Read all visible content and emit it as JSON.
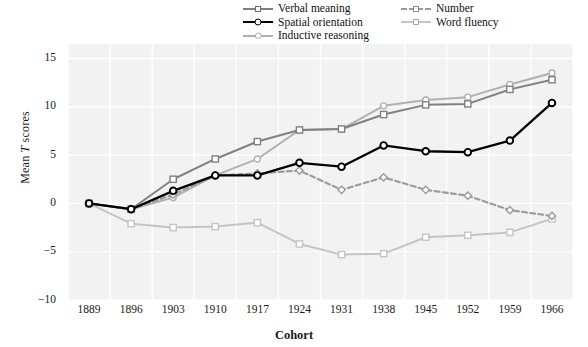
{
  "chart_data": {
    "type": "line",
    "title": "",
    "xlabel": "Cohort",
    "ylabel": "Mean T scores",
    "categories": [
      1889,
      1896,
      1903,
      1910,
      1917,
      1924,
      1931,
      1938,
      1945,
      1952,
      1959,
      1966
    ],
    "xtick_labels": [
      "1889",
      "1896",
      "1903",
      "1910",
      "1917",
      "1924",
      "1931",
      "1938",
      "1945",
      "1952",
      "1959",
      "1966"
    ],
    "ytick_labels": [
      "15",
      "10",
      "5",
      "0",
      "-5",
      "-10"
    ],
    "ytick_values": [
      15,
      10,
      5,
      0,
      -5,
      -10
    ],
    "ylim": [
      -10,
      16.5
    ],
    "grid": true,
    "legend_position": "top-right",
    "series": [
      {
        "name": "Verbal meaning",
        "color": "#808080",
        "marker": "square",
        "dash": "solid",
        "values": [
          0.0,
          -0.6,
          2.5,
          4.6,
          6.4,
          7.6,
          7.7,
          9.2,
          10.2,
          10.3,
          11.8,
          12.8
        ]
      },
      {
        "name": "Spatial orientation",
        "color": "#000000",
        "marker": "circle",
        "dash": "solid",
        "values": [
          0.0,
          -0.6,
          1.3,
          2.9,
          2.9,
          4.2,
          3.8,
          6.0,
          5.4,
          5.3,
          6.5,
          10.4
        ]
      },
      {
        "name": "Inductive reasoning",
        "color": "#b0b0b0",
        "marker": "circle",
        "dash": "solid",
        "values": [
          0.0,
          -0.6,
          0.6,
          2.9,
          4.6,
          7.6,
          7.7,
          10.1,
          10.7,
          11.0,
          12.3,
          13.5
        ]
      },
      {
        "name": "Number",
        "color": "#9a9a9a",
        "marker": "diamond",
        "dash": "dashed",
        "values": [
          0.0,
          -0.6,
          0.9,
          2.9,
          3.1,
          3.4,
          1.4,
          2.7,
          1.4,
          0.8,
          -0.7,
          -1.3
        ]
      },
      {
        "name": "Word fluency",
        "color": "#c4c4c4",
        "marker": "square",
        "dash": "solid",
        "values": [
          0.0,
          -2.1,
          -2.5,
          -2.4,
          -2.0,
          -4.2,
          -5.3,
          -5.2,
          -3.5,
          -3.3,
          -3.0,
          -1.6
        ]
      }
    ]
  },
  "legend": {
    "items": [
      {
        "label": "Verbal meaning"
      },
      {
        "label": "Spatial orientation"
      },
      {
        "label": "Inductive reasoning"
      },
      {
        "label": "Number"
      },
      {
        "label": "Word fluency"
      }
    ]
  },
  "axes": {
    "y_title_prefix": "Mean ",
    "y_title_italic": "T",
    "y_title_suffix": " scores",
    "x_title": "Cohort"
  },
  "colors": {
    "plot_background": "#f2f2f2",
    "grid": "#ffffff",
    "page_background": "#ffffff",
    "verbal_meaning": "#808080",
    "spatial_orientation": "#000000",
    "inductive_reasoning": "#b0b0b0",
    "number": "#9a9a9a",
    "word_fluency": "#c4c4c4"
  }
}
